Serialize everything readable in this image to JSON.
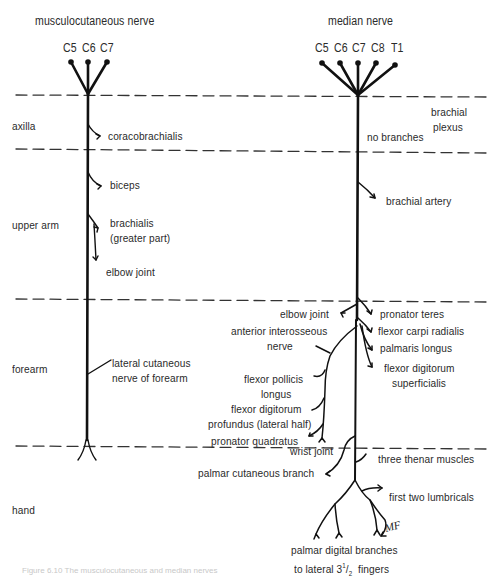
{
  "diagram": {
    "left_nerve": {
      "title": "musculocutaneous nerve",
      "roots": [
        "C5",
        "C6",
        "C7"
      ],
      "branches": {
        "coracobrachialis": "coracobrachialis",
        "biceps": "biceps",
        "brachialis_1": "brachialis",
        "brachialis_2": "(greater part)",
        "elbow_joint": "elbow joint",
        "lateral_cutaneous_1": "lateral cutaneous",
        "lateral_cutaneous_2": "nerve of forearm"
      }
    },
    "right_nerve": {
      "title": "median nerve",
      "roots": [
        "C5",
        "C6",
        "C7",
        "C8",
        "T1"
      ],
      "branches": {
        "brachial_plexus_1": "brachial",
        "brachial_plexus_2": "plexus",
        "no_branches": "no branches",
        "brachial_artery": "brachial artery",
        "elbow_joint": "elbow joint",
        "pronator_teres": "pronator teres",
        "flexor_carpi_radialis": "flexor carpi radialis",
        "palmaris_longus": "palmaris longus",
        "fds_1": "flexor digitorum",
        "fds_2": "superficialis",
        "ain_1": "anterior interosseous",
        "ain_2": "nerve",
        "fpl_1": "flexor  pollicis",
        "fpl_2": "longus",
        "fdp_1": "flexor digitorum",
        "fdp_2": "profundus (lateral half)",
        "pronator_quadratus": "pronator quadratus",
        "wrist_joint": "wrist joint",
        "palmar_cutaneous": "palmar cutaneous  branch",
        "thenar": "three thenar muscles",
        "lumbricals": "first two lumbricals",
        "digital_1": "palmar digital branches",
        "digital_2": "to lateral  3",
        "digital_sup": "1",
        "digital_slash": "/",
        "digital_sub": "2",
        "digital_3": "fingers"
      }
    },
    "regions": [
      "axilla",
      "upper arm",
      "forearm",
      "hand"
    ],
    "signature": "MF",
    "caption": "Figure 6.10  The musculocutaneous and median nerves",
    "colors": {
      "ink": "#111111",
      "text": "#2a2a2a",
      "dash": "#333333"
    }
  }
}
